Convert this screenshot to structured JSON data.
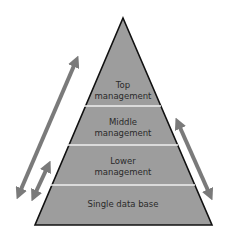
{
  "diagram": {
    "type": "pyramid",
    "levels": [
      {
        "label_line1": "Top",
        "label_line2": "management"
      },
      {
        "label_line1": "Middle",
        "label_line2": "management"
      },
      {
        "label_line1": "Lower",
        "label_line2": "management"
      },
      {
        "label_line1": "Single data base",
        "label_line2": ""
      }
    ],
    "colors": {
      "fill": "#9d9d9d",
      "outline": "#111111",
      "divider": "#f0f0f0",
      "arrow": "#7a7a7a",
      "background": "#ffffff"
    },
    "arrows": [
      {
        "name": "long-left",
        "direction": "bidirectional"
      },
      {
        "name": "short-left",
        "direction": "bidirectional"
      },
      {
        "name": "right",
        "direction": "bidirectional"
      }
    ]
  }
}
